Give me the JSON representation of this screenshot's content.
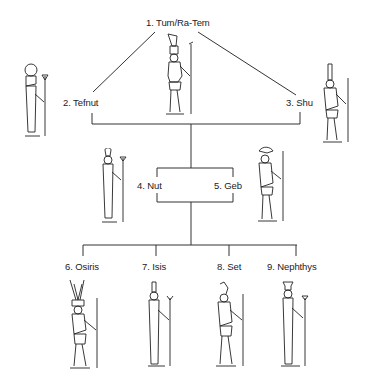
{
  "diagram": {
    "nodes": [
      {
        "id": 1,
        "label": "1. Tum/Ra-Tem",
        "generation": 1
      },
      {
        "id": 2,
        "label": "2. Tefnut",
        "generation": 2
      },
      {
        "id": 3,
        "label": "3. Shu",
        "generation": 2
      },
      {
        "id": 4,
        "label": "4. Nut",
        "generation": 3
      },
      {
        "id": 5,
        "label": "5. Geb",
        "generation": 3
      },
      {
        "id": 6,
        "label": "6. Osiris",
        "generation": 4
      },
      {
        "id": 7,
        "label": "7. Isis",
        "generation": 4
      },
      {
        "id": 8,
        "label": "8. Set",
        "generation": 4
      },
      {
        "id": 9,
        "label": "9. Nephthys",
        "generation": 4
      }
    ],
    "edges": [
      {
        "from": 1,
        "to": 2
      },
      {
        "from": 1,
        "to": 3
      },
      {
        "from": [
          2,
          3
        ],
        "to": [
          4,
          5
        ]
      },
      {
        "from": [
          4,
          5
        ],
        "to": [
          6,
          7,
          8,
          9
        ]
      }
    ],
    "line_color": "#333333"
  }
}
